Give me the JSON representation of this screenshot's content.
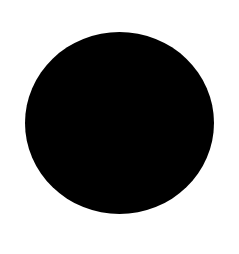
{
  "canvas": {
    "width": 239,
    "height": 254,
    "background": "#ffffff"
  },
  "shape": {
    "type": "circle",
    "fill": "#000000",
    "center_x": 119.5,
    "center_y": 123,
    "radius_x": 94.5,
    "radius_y": 91
  }
}
